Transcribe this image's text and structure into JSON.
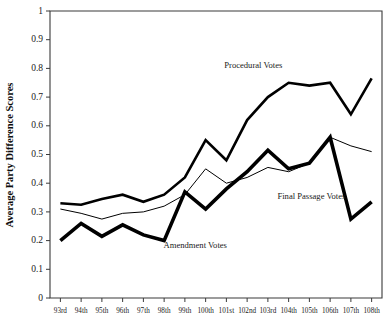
{
  "chart_data": {
    "type": "line",
    "title": "",
    "xlabel": "",
    "ylabel": "Average Party Difference Scores",
    "ylim": [
      0,
      1
    ],
    "ytick_labels": [
      "0",
      "0.1",
      "0.2",
      "0.3",
      "0.4",
      "0.5",
      "0.6",
      "0.7",
      "0.8",
      "0.9",
      "1"
    ],
    "ytick_values": [
      0,
      0.1,
      0.2,
      0.3,
      0.4,
      0.5,
      0.6,
      0.7,
      0.8,
      0.9,
      1
    ],
    "grid": false,
    "legend_position": "inline-annotations",
    "categories": [
      "93rd",
      "94th",
      "95th",
      "96th",
      "97th",
      "98th",
      "99th",
      "100th",
      "101st",
      "102nd",
      "103rd",
      "104th",
      "105th",
      "106th",
      "107th",
      "108th"
    ],
    "series": [
      {
        "name": "Procedural Votes",
        "values": [
          0.33,
          0.325,
          0.345,
          0.36,
          0.335,
          0.36,
          0.42,
          0.55,
          0.48,
          0.62,
          0.7,
          0.75,
          0.74,
          0.75,
          0.64,
          0.765
        ],
        "line_weight": "medium",
        "annotation": "Procedural Votes"
      },
      {
        "name": "Final Passage Votes",
        "values": [
          0.31,
          0.295,
          0.275,
          0.295,
          0.3,
          0.32,
          0.36,
          0.45,
          0.4,
          0.42,
          0.455,
          0.44,
          0.47,
          0.56,
          0.53,
          0.51
        ],
        "line_weight": "thin",
        "annotation": "Final Passage Votes"
      },
      {
        "name": "Amendment Votes",
        "values": [
          0.2,
          0.26,
          0.215,
          0.255,
          0.22,
          0.2,
          0.37,
          0.31,
          0.38,
          0.44,
          0.515,
          0.45,
          0.47,
          0.56,
          0.275,
          0.335
        ],
        "line_weight": "thick",
        "annotation": "Amendment Votes"
      }
    ],
    "annotations": [
      {
        "text": "Procedural Votes",
        "x_index": 9.3,
        "y_value": 0.8,
        "series": "Procedural Votes"
      },
      {
        "text": "Final Passage Votes",
        "x_index": 12.1,
        "y_value": 0.345,
        "series": "Final Passage Votes"
      },
      {
        "text": "Amendment Votes",
        "x_index": 6.5,
        "y_value": 0.175,
        "series": "Amendment Votes"
      }
    ],
    "colors": {
      "line": "#000000",
      "axis": "#3a3a3a",
      "text": "#1a1a1a",
      "background": "#ffffff"
    }
  }
}
